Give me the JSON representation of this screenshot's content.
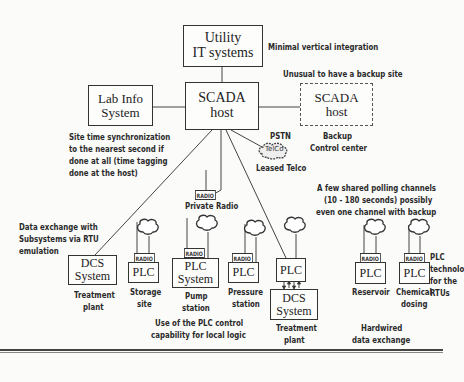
{
  "diagram": {
    "nodes": {
      "utility_it": {
        "line1": "Utility",
        "line2": "IT systems"
      },
      "scada_host": {
        "line1": "SCADA",
        "line2": "host"
      },
      "lab_info": {
        "line1": "Lab Info",
        "line2": "System"
      },
      "backup_scada": {
        "line1": "SCADA",
        "line2": "host"
      },
      "telco_cloud": {
        "label": "TelCo"
      },
      "dcs_treatment_left": {
        "line1": "DCS",
        "line2": "System"
      },
      "plc_storage": {
        "line1": "PLC"
      },
      "plc_pump": {
        "line1": "PLC",
        "line2": "System"
      },
      "plc_pressure": {
        "line1": "PLC"
      },
      "plc_treatment": {
        "line1": "PLC"
      },
      "dcs_treatment_right": {
        "line1": "DCS",
        "line2": "System"
      },
      "plc_reservoir": {
        "line1": "PLC"
      },
      "plc_chemical": {
        "line1": "PLC"
      }
    },
    "radio_tag": "RADIO",
    "annotations": {
      "minimal_integration": "Minimal vertical integration",
      "unusual_backup": "Unusual to have a backup site",
      "backup_cc_1": "Backup",
      "backup_cc_2": "Control center",
      "pstn": "PSTN",
      "leased_telco": "Leased Telco",
      "time_sync_1": "Site time synchronization",
      "time_sync_2": "to the nearest second if",
      "time_sync_3": "done at all (time tagging",
      "time_sync_4": "done at the host)",
      "private_radio": "Private Radio",
      "polling_1": "A few shared polling channels",
      "polling_2": "(10 - 180 seconds) possibly",
      "polling_3": "even one channel with backup",
      "data_exchange_1": "Data exchange with",
      "data_exchange_2": "Subsystems via RTU",
      "data_exchange_3": "emulation",
      "treatment_plant_left_1": "Treatment",
      "treatment_plant_left_2": "plant",
      "storage_1": "Storage",
      "storage_2": "site",
      "pump_1": "Pump",
      "pump_2": "station",
      "pressure_1": "Pressure",
      "pressure_2": "station",
      "treatment_plant_right_1": "Treatment",
      "treatment_plant_right_2": "plant",
      "reservoir": "Reservoir",
      "chemical_1": "Chemical",
      "chemical_2": "dosing",
      "plc_tech_1": "PLC",
      "plc_tech_2": "technolo",
      "plc_tech_3": "for the",
      "plc_tech_4": "RTUs",
      "plc_logic_1": "Use of the PLC control",
      "plc_logic_2": "capability for local logic",
      "hardwired_1": "Hardwired",
      "hardwired_2": "data exchange"
    }
  }
}
